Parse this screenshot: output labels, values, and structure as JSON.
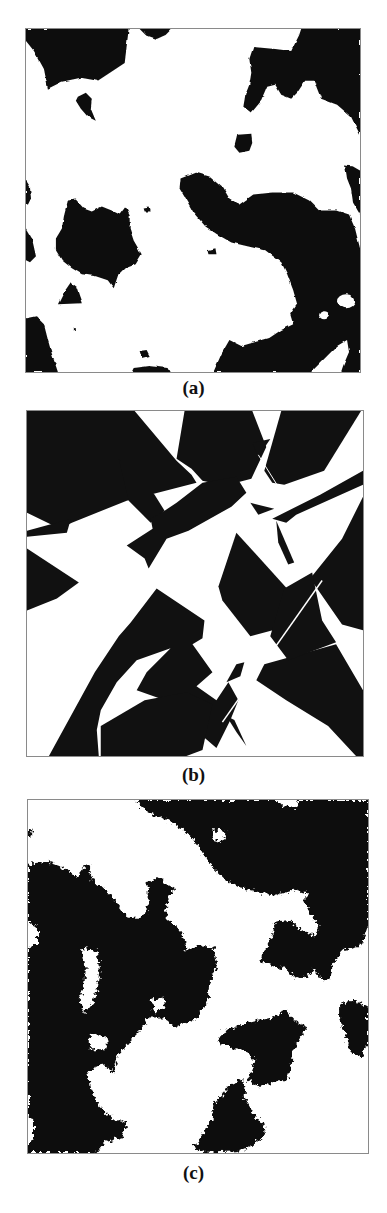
{
  "figure": {
    "panels": [
      {
        "id": "a",
        "label": "(a)",
        "description": "binary microstructure with smooth blob-like black phase"
      },
      {
        "id": "b",
        "label": "(b)",
        "description": "binary microstructure with sharp polygonal black phase"
      },
      {
        "id": "c",
        "label": "(c)",
        "description": "binary microstructure with rough fractal-edged black phase"
      }
    ],
    "colors": {
      "phase_dark": "#111111",
      "phase_light": "#ffffff",
      "frame": "#8a8a8a"
    }
  }
}
